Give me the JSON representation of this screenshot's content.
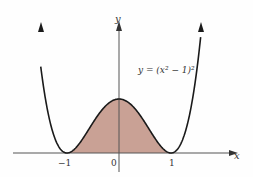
{
  "chart_data": {
    "type": "line",
    "title": "",
    "equation_label": "y = (x² − 1)²",
    "xlabel": "x",
    "ylabel": "y",
    "x_tick_labels": [
      "−1",
      "0",
      "1"
    ],
    "x_ticks": [
      -1,
      0,
      1
    ],
    "xlim": [
      -2.1,
      2.3
    ],
    "ylim": [
      0,
      1.8
    ],
    "grid": false,
    "legend": "none",
    "series": [
      {
        "name": "y = (x^2 - 1)^2",
        "x": [
          -1.6,
          -1.4,
          -1.2,
          -1.0,
          -0.8,
          -0.6,
          -0.4,
          -0.2,
          0.0,
          0.2,
          0.4,
          0.6,
          0.8,
          1.0,
          1.2,
          1.4,
          1.6
        ],
        "values": [
          2.43,
          0.92,
          0.19,
          0.0,
          0.13,
          0.41,
          0.71,
          0.92,
          1.0,
          0.92,
          0.71,
          0.41,
          0.13,
          0.0,
          0.19,
          0.92,
          2.43
        ]
      }
    ],
    "shaded_region": {
      "from": -1,
      "to": 1,
      "color": "#c9a195",
      "description": "area under curve between x = -1 and x = 1"
    }
  },
  "labels": {
    "equation": "y = (x² − 1)²",
    "x_axis": "x",
    "y_axis": "y",
    "tick_neg1": "−1",
    "tick_0": "0",
    "tick_1": "1"
  },
  "colors": {
    "curve": "#1a1a1a",
    "fill": "#c9a195",
    "axis": "#444444"
  }
}
